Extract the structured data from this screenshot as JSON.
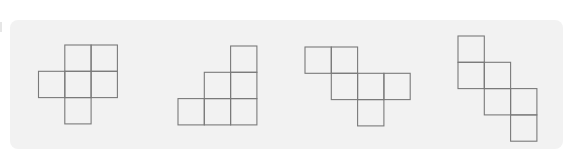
{
  "diagram": {
    "colors": {
      "background": "#f2f2f2",
      "stroke": "#7a7a7a"
    },
    "nets": [
      {
        "id": "net-1",
        "cells": [
          [
            1,
            0
          ],
          [
            2,
            0
          ],
          [
            0,
            1
          ],
          [
            1,
            1
          ],
          [
            2,
            1
          ],
          [
            1,
            2
          ]
        ]
      },
      {
        "id": "net-2",
        "cells": [
          [
            2,
            0
          ],
          [
            1,
            1
          ],
          [
            2,
            1
          ],
          [
            0,
            2
          ],
          [
            1,
            2
          ],
          [
            2,
            2
          ]
        ]
      },
      {
        "id": "net-3",
        "cells": [
          [
            0,
            0
          ],
          [
            1,
            0
          ],
          [
            1,
            1
          ],
          [
            2,
            1
          ],
          [
            3,
            1
          ],
          [
            2,
            2
          ]
        ]
      },
      {
        "id": "net-4",
        "cells": [
          [
            0,
            0
          ],
          [
            0,
            1
          ],
          [
            1,
            1
          ],
          [
            1,
            2
          ],
          [
            2,
            2
          ],
          [
            2,
            3
          ]
        ]
      }
    ]
  }
}
